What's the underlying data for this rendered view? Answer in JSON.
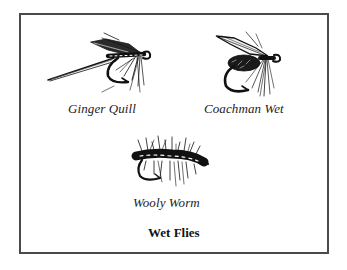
{
  "figure": {
    "title": "Wet Flies",
    "flies": [
      {
        "name": "Ginger Quill",
        "icon": "ginger-quill-fly-illustration"
      },
      {
        "name": "Coachman Wet",
        "icon": "coachman-wet-fly-illustration"
      },
      {
        "name": "Wooly Worm",
        "icon": "wooly-worm-fly-illustration"
      }
    ],
    "colors": {
      "ink": "#111111",
      "border": "#4a4a4a",
      "background": "#ffffff"
    }
  }
}
